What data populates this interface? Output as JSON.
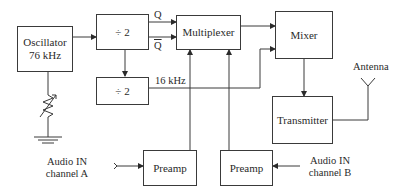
{
  "diagram": {
    "type": "block-diagram",
    "blocks": {
      "oscillator": {
        "line1": "Oscillator",
        "line2": "76 kHz"
      },
      "divider_top": {
        "label": "÷ 2"
      },
      "divider_bottom": {
        "label": "÷ 2"
      },
      "multiplexer": {
        "label": "Multiplexer"
      },
      "mixer": {
        "label": "Mixer"
      },
      "transmitter": {
        "label": "Transmitter"
      },
      "preamp_a": {
        "label": "Preamp"
      },
      "preamp_b": {
        "label": "Preamp"
      }
    },
    "labels": {
      "q": "Q",
      "q_bar": "Q",
      "freq_16k": "16 kHz",
      "antenna": "Antenna",
      "audio_a_line1": "Audio IN",
      "audio_a_line2": "channel A",
      "audio_b_line1": "Audio IN",
      "audio_b_line2": "channel B"
    },
    "connections": [
      {
        "from": "oscillator",
        "to": "divider_top"
      },
      {
        "from": "divider_top",
        "to": "multiplexer",
        "label": "Q"
      },
      {
        "from": "divider_top",
        "to": "multiplexer",
        "label": "Q-bar"
      },
      {
        "from": "divider_top",
        "to": "divider_bottom"
      },
      {
        "from": "divider_bottom",
        "to": "mixer",
        "label": "16 kHz"
      },
      {
        "from": "multiplexer",
        "to": "mixer"
      },
      {
        "from": "mixer",
        "to": "transmitter"
      },
      {
        "from": "transmitter",
        "to": "antenna"
      },
      {
        "from": "audio_in_a",
        "to": "preamp_a"
      },
      {
        "from": "audio_in_b",
        "to": "preamp_b"
      },
      {
        "from": "preamp_a",
        "to": "multiplexer"
      },
      {
        "from": "preamp_b",
        "to": "multiplexer"
      },
      {
        "from": "oscillator",
        "to": "variable-resistor-to-ground"
      }
    ]
  }
}
